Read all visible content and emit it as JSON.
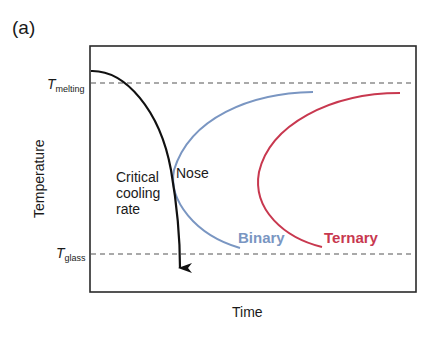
{
  "panel_label": "(a)",
  "axes": {
    "x_label": "Time",
    "y_label": "Temperature"
  },
  "reference_lines": {
    "melting": {
      "symbol": "T",
      "subscript": "melting"
    },
    "glass": {
      "symbol": "T",
      "subscript": "glass"
    }
  },
  "annotations": {
    "critical_cooling_rate": [
      "Critical",
      "cooling",
      "rate"
    ],
    "nose": "Nose"
  },
  "curves": {
    "binary": {
      "label": "Binary",
      "color": "#7a96c2"
    },
    "ternary": {
      "label": "Ternary",
      "color": "#c8384f"
    },
    "cooling": {
      "color": "#111111"
    }
  },
  "colors": {
    "frame": "#2a2a2a",
    "dashed": "#555555"
  }
}
